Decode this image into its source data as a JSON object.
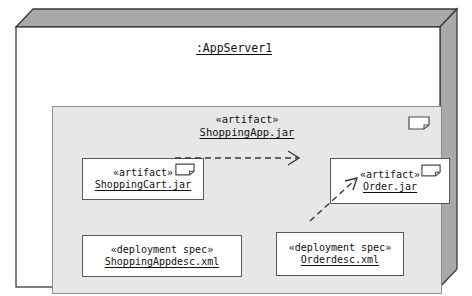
{
  "diagram": {
    "type": "uml-deployment-diagram",
    "node": {
      "name": ":AppServer1",
      "icon": "node-3d-box"
    },
    "container": {
      "stereotype": "«artifact»",
      "name": "ShoppingApp.jar",
      "icon": "artifact-page-icon"
    },
    "elements": [
      {
        "id": "shoppingcart",
        "stereotype": "«artifact»",
        "name": "ShoppingCart.jar",
        "icon": "artifact-page-icon"
      },
      {
        "id": "order",
        "stereotype": "«artifact»",
        "name": "Order.jar",
        "icon": "artifact-page-icon"
      },
      {
        "id": "appdesc",
        "stereotype": "«deployment spec»",
        "name": "ShoppingAppdesc.xml",
        "icon": "none"
      },
      {
        "id": "orderdesc",
        "stereotype": "«deployment spec»",
        "name": "Orderdesc.xml",
        "icon": "none"
      }
    ],
    "connectors": [
      {
        "id": "dep-cart-to-order",
        "from": "shoppingcart",
        "to": "order",
        "style": "dashed",
        "arrowhead": "open",
        "label": ""
      },
      {
        "id": "dep-orderdesc-to-order",
        "from": "orderdesc",
        "to": "order",
        "style": "dashed",
        "arrowhead": "open",
        "label": ""
      }
    ],
    "colors": {
      "background": "#ffffff",
      "node_fill": "#ffffff",
      "node_3d_face": "#a8a8a8",
      "container_fill": "#e7e7e7",
      "box_fill": "#ffffff",
      "stroke": "#595959",
      "text": "#111111"
    }
  }
}
